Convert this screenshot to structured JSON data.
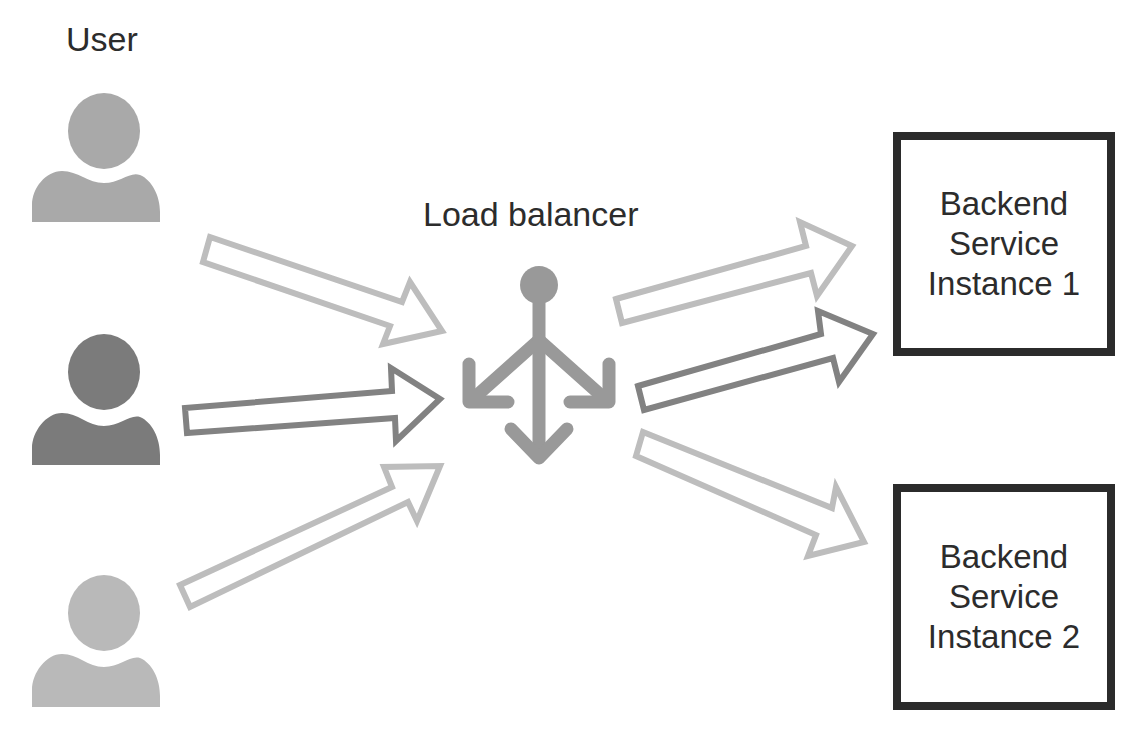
{
  "labels": {
    "user": "User",
    "load_balancer": "Load balancer"
  },
  "backends": [
    {
      "line1": "Backend",
      "line2": "Service",
      "line3": "Instance 1"
    },
    {
      "line1": "Backend",
      "line2": "Service",
      "line3": "Instance 2"
    }
  ],
  "colors": {
    "user_1": "#a9a9a9",
    "user_2": "#7b7b7b",
    "user_3": "#b9b9b9",
    "arrow_light": "#bdbdbd",
    "arrow_dark": "#828282",
    "load_balancer_icon": "#999999",
    "box_border": "#2b2b2b",
    "text": "#2c2c2c"
  },
  "icons": {
    "users": [
      "user-icon",
      "user-icon",
      "user-icon"
    ],
    "load_balancer": "load-balancer-icon",
    "arrows": [
      "arrow-right-icon"
    ]
  }
}
